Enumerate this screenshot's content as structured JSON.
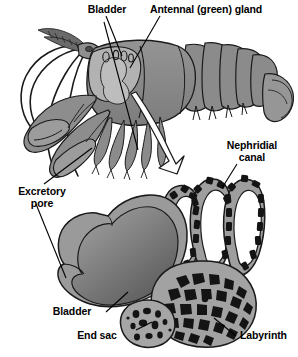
{
  "figure": {
    "background_color": "#ffffff",
    "width": 298,
    "height": 357
  },
  "labels": {
    "bladder_top": "Bladder",
    "antennal_gland": "Antennal (green) gland",
    "nephridial_canal_line1": "Nephridial",
    "nephridial_canal_line2": "canal",
    "excretory_pore_line1": "Excretory",
    "excretory_pore_line2": "pore",
    "bladder_bottom": "Bladder",
    "end_sac": "End sac",
    "labyrinth": "Labyrinth"
  },
  "colors": {
    "outline": "#1a1a1a",
    "body_gray": "#8a8a8a",
    "body_gray_dark": "#6e6e6e",
    "body_gray_light": "#a9a9a9",
    "carapace_light": "#b4b4b4",
    "bladder_wall": "#9a9a9a",
    "bladder_lumen_light": "#8e8e8e",
    "bladder_lumen_dark": "#5d5d5d",
    "tubule_wall": "#9e9e9e",
    "lumen_black": "#141414",
    "label_text": "#000000",
    "leader_line": "#000000",
    "arrow_fill": "#ffffff"
  },
  "parts": [
    {
      "name": "crayfish-whole-animal",
      "description": "lateral view of crayfish, upper portion of figure"
    },
    {
      "name": "antennal-gland-outline",
      "description": "pale outline of green gland within head"
    },
    {
      "name": "magnification-arrow",
      "description": "white arrow from head to enlarged gland diagram"
    },
    {
      "name": "bladder-sac",
      "description": "large sac with graded interior, left of enlarged diagram"
    },
    {
      "name": "nephridial-canal-coils",
      "description": "looping coiled tubule above labyrinth"
    },
    {
      "name": "labyrinth-mass",
      "description": "spongy cellular mass, lower right"
    },
    {
      "name": "end-sac-lobe",
      "description": "small speckled round lobe, lower left of labyrinth"
    }
  ]
}
